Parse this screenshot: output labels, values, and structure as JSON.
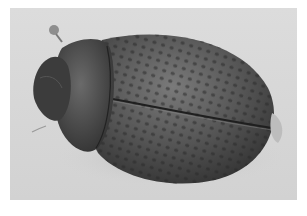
{
  "image": {
    "subject": "beetle",
    "description": "Dorsal view of a dark mottled oval beetle on a light gray background",
    "colors": {
      "border": "#ffffff",
      "background": "#d8d8d8",
      "body_dark": "#3a3a3a",
      "body_mid": "#5a5a5a",
      "body_light": "#7a7a7a",
      "spots": "#2e2e2e"
    }
  }
}
